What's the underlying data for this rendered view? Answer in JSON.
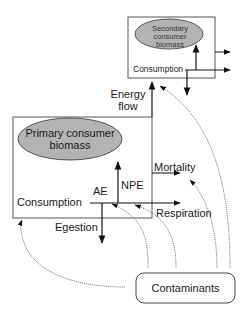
{
  "diagram": {
    "secondary": {
      "biomass_line1": "Secondary consumer",
      "biomass_line2": "biomass",
      "consumption": "Consumption"
    },
    "energy_flow": {
      "line1": "Energy",
      "line2": "flow"
    },
    "primary": {
      "biomass_line1": "Primary consumer",
      "biomass_line2": "biomass",
      "consumption": "Consumption",
      "ae": "AE",
      "npe": "NPE",
      "mortality": "Mortality",
      "respiration": "Respiration",
      "egestion": "Egestion"
    },
    "contaminants": "Contaminants",
    "colors": {
      "ellipse_fill": "#b3b3b3",
      "line": "#1a1a1a",
      "curve": "#555555"
    }
  }
}
